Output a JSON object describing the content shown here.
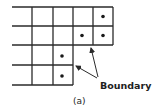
{
  "figure": {
    "caption": "(a)",
    "annotation_label": "Boundary",
    "colors": {
      "line": "#2a2a2a",
      "dot": "#1a1a1a",
      "background": "#ffffff"
    },
    "grid": {
      "rows": [
        {
          "row": 1,
          "y_top": 7,
          "y_bottom": 26,
          "x_end": 113,
          "dots_in_cols": [
            5
          ]
        },
        {
          "row": 2,
          "y_top": 26,
          "y_bottom": 45,
          "x_end": 113,
          "dots_in_cols": [
            4,
            5
          ]
        },
        {
          "row": 3,
          "y_top": 45,
          "y_bottom": 65,
          "x_end": 73,
          "dots_in_cols": [
            3
          ]
        },
        {
          "row": 4,
          "y_top": 65,
          "y_bottom": 85,
          "x_end": 73,
          "dots_in_cols": [
            3
          ]
        }
      ],
      "column_lines_x": [
        32,
        53,
        73,
        93,
        113
      ]
    },
    "arrows": [
      {
        "name": "arrow-to-lower-step",
        "from": [
          97,
          78
        ],
        "to": [
          75,
          65
        ]
      },
      {
        "name": "arrow-to-upper-step",
        "from": [
          98,
          77
        ],
        "to": [
          91,
          47
        ]
      }
    ]
  }
}
